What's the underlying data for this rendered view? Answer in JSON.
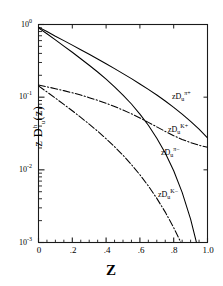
{
  "chart_data": {
    "type": "line",
    "title": "",
    "xlabel": "Z",
    "ylabel": "z D",
    "ylabel_full": "z Du h(z)",
    "yscale": "log",
    "xscale": "linear",
    "xlim": [
      0,
      1.0
    ],
    "ylim": [
      0.001,
      1.0
    ],
    "grid": false,
    "legend_position": "inline-right",
    "xticks": [
      "0",
      ".2",
      ".4",
      ".6",
      ".8",
      "1.0"
    ],
    "xtick_values": [
      0,
      0.2,
      0.4,
      0.6,
      0.8,
      1.0
    ],
    "ytick_labels": [
      "10",
      "10",
      "10",
      "10"
    ],
    "ytick_exponents": [
      "0",
      "-1",
      "-2",
      "-3"
    ],
    "ytick_values": [
      1.0,
      0.1,
      0.01,
      0.001
    ],
    "minor_ticks": true,
    "series": [
      {
        "name": "zD_u^pi+",
        "label_base": "zD",
        "label_sub": "u",
        "label_sup": "π+",
        "style": "solid",
        "color": "#000000",
        "x": [
          0.0,
          0.05,
          0.1,
          0.15,
          0.2,
          0.25,
          0.3,
          0.35,
          0.4,
          0.45,
          0.5,
          0.55,
          0.6,
          0.65,
          0.7,
          0.75,
          0.8,
          0.85,
          0.9,
          0.95,
          1.0
        ],
        "y": [
          0.92,
          0.8,
          0.69,
          0.6,
          0.52,
          0.45,
          0.39,
          0.335,
          0.288,
          0.247,
          0.211,
          0.18,
          0.152,
          0.128,
          0.107,
          0.0885,
          0.0725,
          0.0585,
          0.0465,
          0.0362,
          0.0275
        ]
      },
      {
        "name": "zD_u^pi-",
        "label_base": "zD",
        "label_sub": "u",
        "label_sup": "π−",
        "style": "solid",
        "color": "#000000",
        "x": [
          0.0,
          0.05,
          0.1,
          0.15,
          0.2,
          0.25,
          0.3,
          0.35,
          0.4,
          0.45,
          0.5,
          0.55,
          0.6,
          0.65,
          0.7,
          0.75,
          0.8,
          0.85,
          0.9,
          0.95
        ],
        "y": [
          0.9,
          0.745,
          0.615,
          0.505,
          0.415,
          0.338,
          0.275,
          0.222,
          0.177,
          0.139,
          0.107,
          0.0805,
          0.0585,
          0.041,
          0.0272,
          0.017,
          0.0097,
          0.0049,
          0.0021,
          0.00072
        ]
      },
      {
        "name": "zD_u^K+",
        "label_base": "zD",
        "label_sub": "u",
        "label_sup": "K+",
        "style": "dashdot",
        "color": "#000000",
        "x": [
          0.0,
          0.05,
          0.1,
          0.15,
          0.2,
          0.25,
          0.3,
          0.35,
          0.4,
          0.45,
          0.5,
          0.55,
          0.6,
          0.65,
          0.7,
          0.75,
          0.8,
          0.85,
          0.9,
          0.95,
          1.0
        ],
        "y": [
          0.147,
          0.139,
          0.131,
          0.123,
          0.115,
          0.107,
          0.0985,
          0.0905,
          0.0825,
          0.0745,
          0.0665,
          0.059,
          0.0518,
          0.045,
          0.039,
          0.0338,
          0.0295,
          0.0262,
          0.0237,
          0.0218,
          0.0205
        ]
      },
      {
        "name": "zD_u^K-",
        "label_base": "zD",
        "label_sub": "u",
        "label_sup": "K−",
        "style": "dashdot",
        "color": "#000000",
        "x": [
          0.0,
          0.05,
          0.1,
          0.15,
          0.2,
          0.25,
          0.3,
          0.35,
          0.4,
          0.45,
          0.5,
          0.55,
          0.6,
          0.65,
          0.7,
          0.75,
          0.8,
          0.85,
          0.9,
          0.95
        ],
        "y": [
          0.143,
          0.118,
          0.097,
          0.0795,
          0.065,
          0.0528,
          0.0425,
          0.034,
          0.0268,
          0.0208,
          0.0159,
          0.0118,
          0.00855,
          0.006,
          0.00405,
          0.00262,
          0.0016,
          0.00092,
          0.0005,
          0.00026
        ]
      }
    ],
    "annotations": [
      {
        "text": "zD_u^pi+",
        "x": 0.8,
        "y": 0.082
      },
      {
        "text": "zD_u^K+",
        "x": 0.78,
        "y": 0.0295
      },
      {
        "text": "zD_u^pi-",
        "x": 0.74,
        "y": 0.015
      },
      {
        "text": "zD_u^K-",
        "x": 0.73,
        "y": 0.00295
      }
    ]
  },
  "axes": {
    "y_title_main": "z D",
    "y_title_sub": "u",
    "y_title_sup": "h",
    "y_title_arg": "(z)",
    "x_title": "Z"
  }
}
